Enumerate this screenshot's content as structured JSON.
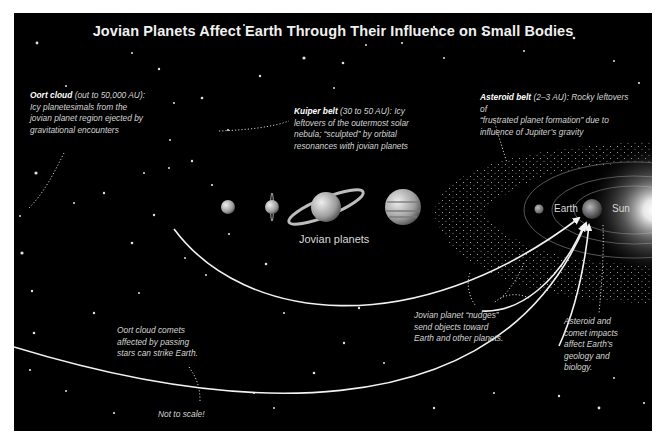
{
  "title": "Jovian Planets Affect Earth Through Their Influence on Small Bodies",
  "annotations": {
    "oort_cloud": {
      "heading": "Oort cloud",
      "detail": "(out to 50,000 AU):",
      "lines": [
        "Icy planetesimals from the",
        "jovian planet region ejected by",
        "gravitational encounters"
      ]
    },
    "kuiper_belt": {
      "heading": "Kuiper belt",
      "detail": "(30 to 50 AU): Icy",
      "lines": [
        "leftovers of the outermost solar",
        "nebula; “sculpted” by orbital",
        "resonances with jovian planets"
      ]
    },
    "asteroid_belt": {
      "heading": "Asteroid belt",
      "detail": "(2–3 AU): Rocky leftovers of",
      "lines": [
        "“frustrated planet formation” due to",
        "influence of Jupiter’s gravity"
      ]
    },
    "jovian_nudges": {
      "lines": [
        "Jovian planet “nudges”",
        "send objects toward",
        "Earth and other planets."
      ]
    },
    "impacts": {
      "lines": [
        "Asteroid and",
        "comet impacts",
        "affect Earth’s",
        "geology and",
        "biology."
      ]
    },
    "oort_comets": {
      "lines": [
        "Oort cloud comets",
        "affected by passing",
        "stars can strike Earth."
      ]
    }
  },
  "labels": {
    "jovian_planets": "Jovian planets",
    "earth": "Earth",
    "sun": "Sun",
    "not_to_scale": "Not to scale!"
  },
  "colors": {
    "background": "#000000",
    "text": "#d9d9d9",
    "arrow": "#f2f2f2"
  }
}
